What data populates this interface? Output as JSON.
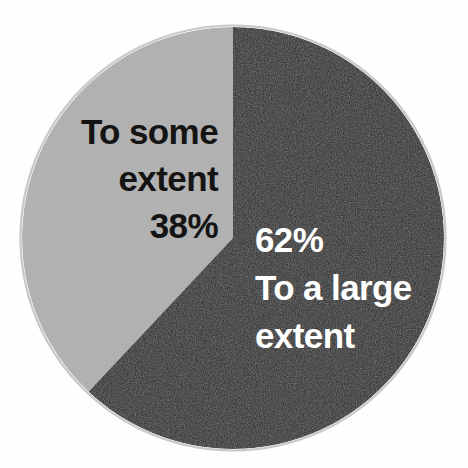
{
  "chart_data": {
    "type": "pie",
    "title": "",
    "subtitle": "",
    "xlabel": "",
    "ylabel": "",
    "legend_position": "none",
    "grid": false,
    "start_angle_deg": 0,
    "direction": "clockwise",
    "total": 100,
    "unit": "%",
    "categories": [
      "To a large extent",
      "To some extent"
    ],
    "values": [
      62,
      38
    ],
    "slices": [
      {
        "label": "To a large extent",
        "value": 62,
        "value_label": "62%",
        "color": "#1a1a1a",
        "text_color": "#ffffff",
        "label_lines": [
          "62%",
          "To a large",
          "extent"
        ]
      },
      {
        "label": "To some extent",
        "value": 38,
        "value_label": "38%",
        "color": "#b4b4b4",
        "text_color": "#141414",
        "label_lines": [
          "To some",
          "extent",
          "38%"
        ]
      }
    ]
  },
  "figure": {
    "background_color": "#fefefe",
    "rim_color": "#8c8c8c"
  },
  "labels": {
    "some_extent": {
      "line1": "To some",
      "line2": "extent",
      "line3": "38%"
    },
    "large_extent": {
      "line1": "62%",
      "line2": "To a large",
      "line3": "extent"
    }
  }
}
